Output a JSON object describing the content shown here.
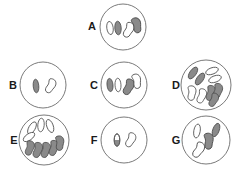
{
  "figure": {
    "title": "",
    "background_color": "#ffffff",
    "membrane_stroke": "#6b6b6b",
    "chromosome_stroke": "#4a4a4a",
    "chromosome_fill_dark": "#8a8a8a",
    "chromosome_fill_light": "#ffffff"
  },
  "cells": [
    {
      "label": "A",
      "cx": 123,
      "cy": 27,
      "r": 23,
      "label_x": 92,
      "label_y": 27,
      "chromosome_count": 4,
      "chromosomes": [
        {
          "name": "rod-light",
          "shape": "rod",
          "fill": "light",
          "x": 110,
          "y": 28,
          "rx": 3.2,
          "ry": 6.6,
          "rot": -8
        },
        {
          "name": "rod-dark",
          "shape": "rod",
          "fill": "dark",
          "x": 118,
          "y": 28,
          "rx": 3.2,
          "ry": 6.8,
          "rot": -4
        },
        {
          "name": "bean-light",
          "shape": "bean",
          "fill": "light",
          "x": 129,
          "y": 30,
          "s": 1.05,
          "rot": 10
        },
        {
          "name": "bean-dark",
          "shape": "bean",
          "fill": "dark",
          "x": 137,
          "y": 25,
          "s": 1.05,
          "rot": -28
        }
      ]
    },
    {
      "label": "B",
      "cx": 43,
      "cy": 85,
      "r": 23,
      "label_x": 13,
      "label_y": 86,
      "chromosome_count": 2,
      "chromosomes": [
        {
          "name": "rod-dark",
          "shape": "rod",
          "fill": "dark",
          "x": 36,
          "y": 86,
          "rx": 2.8,
          "ry": 6.8,
          "rot": -5
        },
        {
          "name": "bean-light",
          "shape": "bean",
          "fill": "light",
          "x": 51,
          "y": 86,
          "s": 1.0,
          "rot": 12
        }
      ]
    },
    {
      "label": "C",
      "cx": 124,
      "cy": 85,
      "r": 23,
      "label_x": 94,
      "label_y": 86,
      "chromosome_count": 4,
      "chromosomes": [
        {
          "name": "rod-dark",
          "shape": "rod",
          "fill": "dark",
          "x": 110,
          "y": 85,
          "rx": 3.0,
          "ry": 6.6,
          "rot": -6
        },
        {
          "name": "rod-light",
          "shape": "rod",
          "fill": "light",
          "x": 118,
          "y": 85,
          "rx": 3.0,
          "ry": 6.8,
          "rot": -3
        },
        {
          "name": "bean-dark",
          "shape": "bean",
          "fill": "dark",
          "x": 129,
          "y": 87,
          "s": 1.1,
          "rot": 8
        },
        {
          "name": "bean-light",
          "shape": "bean",
          "fill": "light",
          "x": 137,
          "y": 81,
          "s": 1.0,
          "rot": -25
        }
      ]
    },
    {
      "label": "D",
      "cx": 206,
      "cy": 85,
      "r": 25,
      "label_x": 176,
      "label_y": 86,
      "chromosome_count": 9,
      "chromosomes": [
        {
          "name": "rod-dark",
          "shape": "rod",
          "fill": "dark",
          "x": 193,
          "y": 73,
          "rx": 3.2,
          "ry": 6.8,
          "rot": 35
        },
        {
          "name": "rod-dark",
          "shape": "rod",
          "fill": "dark",
          "x": 200,
          "y": 79,
          "rx": 3.2,
          "ry": 6.8,
          "rot": 35
        },
        {
          "name": "rod-light",
          "shape": "rod",
          "fill": "light",
          "x": 212,
          "y": 71,
          "rx": 3.2,
          "ry": 6.6,
          "rot": 70
        },
        {
          "name": "rod-light",
          "shape": "rod",
          "fill": "light",
          "x": 215,
          "y": 79,
          "rx": 3.2,
          "ry": 6.6,
          "rot": 70
        },
        {
          "name": "bean-light",
          "shape": "bean",
          "fill": "light",
          "x": 192,
          "y": 93,
          "s": 1.0,
          "rot": -10
        },
        {
          "name": "bean-light",
          "shape": "bean",
          "fill": "light",
          "x": 202,
          "y": 96,
          "s": 1.0,
          "rot": 5
        },
        {
          "name": "bean-dark",
          "shape": "bean",
          "fill": "dark",
          "x": 211,
          "y": 93,
          "s": 1.05,
          "rot": 0
        },
        {
          "name": "bean-dark",
          "shape": "bean",
          "fill": "dark",
          "x": 218,
          "y": 91,
          "s": 1.05,
          "rot": 0
        },
        {
          "name": "bean-dark",
          "shape": "bean",
          "fill": "dark",
          "x": 214,
          "y": 100,
          "s": 0.95,
          "rot": 10
        }
      ]
    },
    {
      "label": "E",
      "cx": 44,
      "cy": 140,
      "r": 25,
      "label_x": 14,
      "label_y": 141,
      "chromosome_count": 9,
      "chromosomes": [
        {
          "name": "rod-light",
          "shape": "rod",
          "fill": "light",
          "x": 32,
          "y": 128,
          "rx": 3.2,
          "ry": 6.8,
          "rot": 30
        },
        {
          "name": "rod-light",
          "shape": "rod",
          "fill": "light",
          "x": 41,
          "y": 125,
          "rx": 3.2,
          "ry": 6.8,
          "rot": 5
        },
        {
          "name": "rod-light",
          "shape": "rod",
          "fill": "light",
          "x": 50,
          "y": 126,
          "rx": 3.2,
          "ry": 6.8,
          "rot": -20
        },
        {
          "name": "rod-light",
          "shape": "rod",
          "fill": "light",
          "x": 29,
          "y": 137,
          "rx": 3.2,
          "ry": 6.6,
          "rot": 55
        },
        {
          "name": "bean-dark",
          "shape": "bean",
          "fill": "dark",
          "x": 30,
          "y": 148,
          "s": 1.0,
          "rot": 0
        },
        {
          "name": "bean-dark",
          "shape": "bean",
          "fill": "dark",
          "x": 38,
          "y": 150,
          "s": 1.05,
          "rot": 0
        },
        {
          "name": "bean-dark",
          "shape": "bean",
          "fill": "dark",
          "x": 46,
          "y": 150,
          "s": 1.05,
          "rot": 0
        },
        {
          "name": "bean-dark",
          "shape": "bean",
          "fill": "dark",
          "x": 54,
          "y": 148,
          "s": 1.05,
          "rot": 0
        },
        {
          "name": "bean-dark",
          "shape": "bean",
          "fill": "dark",
          "x": 60,
          "y": 143,
          "s": 1.0,
          "rot": -15
        }
      ]
    },
    {
      "label": "F",
      "cx": 124,
      "cy": 140,
      "r": 23,
      "label_x": 94,
      "label_y": 141,
      "chromosome_count": 2,
      "chromosomes": [
        {
          "name": "rod-half-dark",
          "shape": "rod",
          "fill": "half-dark",
          "x": 117,
          "y": 140,
          "rx": 2.8,
          "ry": 6.2,
          "rot": 0
        },
        {
          "name": "bean-light",
          "shape": "bean",
          "fill": "light",
          "x": 131,
          "y": 140,
          "s": 1.0,
          "rot": 10
        }
      ]
    },
    {
      "label": "G",
      "cx": 206,
      "cy": 140,
      "r": 24,
      "label_x": 176,
      "label_y": 141,
      "chromosome_count": 4,
      "chromosomes": [
        {
          "name": "rod-light",
          "shape": "rod",
          "fill": "light",
          "x": 197,
          "y": 131,
          "rx": 3.2,
          "ry": 7.0,
          "rot": 10
        },
        {
          "name": "rod-dark",
          "shape": "rod",
          "fill": "dark",
          "x": 216,
          "y": 130,
          "rx": 3.2,
          "ry": 7.0,
          "rot": 20
        },
        {
          "name": "bean-dark",
          "shape": "bean",
          "fill": "dark",
          "x": 209,
          "y": 141,
          "s": 1.1,
          "rot": -15
        },
        {
          "name": "bean-light",
          "shape": "bean",
          "fill": "light",
          "x": 199,
          "y": 150,
          "s": 1.1,
          "rot": 15
        }
      ]
    }
  ]
}
